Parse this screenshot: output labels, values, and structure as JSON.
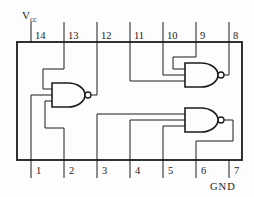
{
  "labels": {
    "vcc_main": "V",
    "vcc_sub": "cc",
    "gnd": "GND"
  },
  "colors": {
    "line": "#1c1c1c",
    "background": "#fdfdfd"
  },
  "ic": {
    "x": 17,
    "y": 42,
    "width": 225,
    "height": 118
  },
  "pins": {
    "xs": [
      31,
      64,
      97,
      130,
      163,
      196,
      229
    ],
    "top_numbers": [
      "14",
      "13",
      "12",
      "11",
      "10",
      "9",
      "8"
    ],
    "bottom_numbers": [
      "1",
      "2",
      "3",
      "4",
      "5",
      "6",
      "7"
    ],
    "top_lead_y": 22,
    "bottom_lead_y": 178
  },
  "gate_size": {
    "w": 33,
    "h": 24,
    "bubble_r": 3,
    "flat": 16
  },
  "gates": [
    {
      "id": "nand-gate-left",
      "x": 52,
      "y": 83
    },
    {
      "id": "nand-gate-top-right",
      "x": 185,
      "y": 63
    },
    {
      "id": "nand-gate-bottom-right",
      "x": 185,
      "y": 108
    }
  ],
  "wires": [
    {
      "name": "wire-pin13-to-left-gate-input1",
      "points": [
        [
          64,
          42
        ],
        [
          64,
          69
        ],
        [
          43,
          69
        ],
        [
          43,
          89
        ],
        [
          52,
          89
        ]
      ]
    },
    {
      "name": "wire-pin1-to-left-gate-input2",
      "points": [
        [
          31,
          160
        ],
        [
          31,
          95
        ],
        [
          52,
          95
        ]
      ]
    },
    {
      "name": "wire-pin2-to-left-gate-input3",
      "points": [
        [
          64,
          160
        ],
        [
          64,
          128
        ],
        [
          45,
          128
        ],
        [
          45,
          101
        ],
        [
          52,
          101
        ]
      ]
    },
    {
      "name": "wire-left-gate-output-to-pin12",
      "points": [
        [
          91,
          95
        ],
        [
          97,
          95
        ],
        [
          97,
          42
        ]
      ]
    },
    {
      "name": "wire-pin9-to-top-right-gate-input1",
      "points": [
        [
          196,
          42
        ],
        [
          196,
          57
        ],
        [
          173,
          57
        ],
        [
          173,
          69
        ],
        [
          185,
          69
        ]
      ]
    },
    {
      "name": "wire-pin10-to-top-right-gate-input2",
      "points": [
        [
          163,
          42
        ],
        [
          163,
          75
        ],
        [
          185,
          75
        ]
      ]
    },
    {
      "name": "wire-pin11-to-top-right-gate-input3",
      "points": [
        [
          130,
          42
        ],
        [
          130,
          81
        ],
        [
          185,
          81
        ]
      ]
    },
    {
      "name": "wire-top-right-gate-output-to-pin8",
      "points": [
        [
          224,
          75
        ],
        [
          229,
          75
        ],
        [
          229,
          42
        ]
      ]
    },
    {
      "name": "wire-pin3-to-bottom-right-gate-input1",
      "points": [
        [
          97,
          160
        ],
        [
          97,
          114
        ],
        [
          185,
          114
        ]
      ]
    },
    {
      "name": "wire-pin4-to-bottom-right-gate-input2",
      "points": [
        [
          130,
          160
        ],
        [
          130,
          120
        ],
        [
          185,
          120
        ]
      ]
    },
    {
      "name": "wire-pin5-to-bottom-right-gate-input3",
      "points": [
        [
          163,
          160
        ],
        [
          163,
          126
        ],
        [
          185,
          126
        ]
      ]
    },
    {
      "name": "wire-bottom-right-gate-output-to-pin6",
      "points": [
        [
          224,
          120
        ],
        [
          233,
          120
        ],
        [
          233,
          141
        ],
        [
          196,
          141
        ],
        [
          196,
          160
        ]
      ]
    }
  ],
  "label_positions": {
    "vcc": {
      "x": 22,
      "y": 19
    },
    "gnd": {
      "x": 210,
      "y": 190
    }
  }
}
